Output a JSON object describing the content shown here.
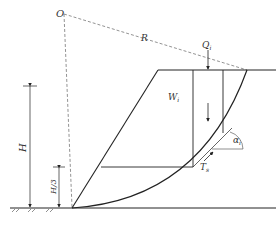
{
  "diagram": {
    "type": "slope-stability-slice-method",
    "labels": {
      "center": "O",
      "radius": "R",
      "surcharge": "Q",
      "surcharge_sub": "i",
      "weight": "W",
      "weight_sub": "i",
      "angle": "α",
      "angle_sub": "i",
      "shear": "T",
      "shear_sub": "s",
      "height": "H",
      "third_height": "H/3"
    },
    "colors": {
      "line": "#222222",
      "dashed": "#777777",
      "text": "#333333"
    }
  }
}
